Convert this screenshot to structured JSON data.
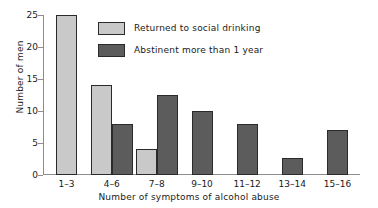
{
  "chart_data": {
    "type": "bar",
    "title": "",
    "xlabel": "Number of symptoms of alcohol abuse",
    "ylabel": "Number of men",
    "categories": [
      "1–3",
      "4–6",
      "7–8",
      "9–10",
      "11–12",
      "13–14",
      "15–16"
    ],
    "series": [
      {
        "name": "Returned to social drinking",
        "color": "#c9c9c9",
        "values": [
          25,
          14,
          4,
          0,
          0,
          0,
          0
        ]
      },
      {
        "name": "Abstinent more than 1 year",
        "color": "#5c5c5c",
        "values": [
          0,
          8,
          12.5,
          10,
          8,
          2.6,
          7
        ]
      }
    ],
    "ylim": [
      0,
      25
    ],
    "yticks": [
      0,
      5,
      10,
      15,
      20,
      25
    ],
    "yticklabels": [
      "0",
      "5",
      "10",
      "15",
      "20",
      "25"
    ],
    "grid": false,
    "legend_position": "upper-center"
  },
  "legend": {
    "items": [
      {
        "label": "Returned to social drinking",
        "swatch": "light"
      },
      {
        "label": "Abstinent more than 1 year",
        "swatch": "dark"
      }
    ]
  },
  "axes": {
    "y_title": "Number of men",
    "x_title": "Number of symptoms of alcohol abuse"
  }
}
